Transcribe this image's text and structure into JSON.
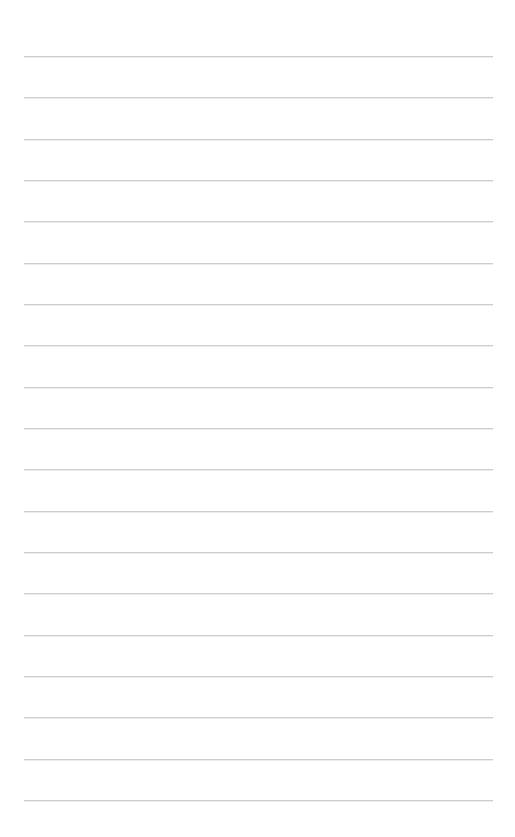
{
  "document": {
    "kind": "lined-paper",
    "title": "",
    "body_text": "",
    "background_color": "#ffffff",
    "width_px": 515,
    "height_px": 837
  },
  "ruling": {
    "line_color": "#cdcdd1",
    "line_thickness_px": 1,
    "line_count": 19,
    "left_margin_px": 24,
    "right_edge_px": 493,
    "line_length_px": 469,
    "first_line_y_px": 56,
    "last_line_y_px": 800,
    "line_spacing_px": 41.3,
    "lines": [
      {
        "index": 1,
        "y": 56,
        "x_start": 24,
        "x_end": 493,
        "content": ""
      },
      {
        "index": 2,
        "y": 97,
        "x_start": 24,
        "x_end": 493,
        "content": ""
      },
      {
        "index": 3,
        "y": 139,
        "x_start": 24,
        "x_end": 493,
        "content": ""
      },
      {
        "index": 4,
        "y": 180,
        "x_start": 24,
        "x_end": 493,
        "content": ""
      },
      {
        "index": 5,
        "y": 221,
        "x_start": 24,
        "x_end": 493,
        "content": ""
      },
      {
        "index": 6,
        "y": 263,
        "x_start": 24,
        "x_end": 493,
        "content": ""
      },
      {
        "index": 7,
        "y": 304,
        "x_start": 24,
        "x_end": 493,
        "content": ""
      },
      {
        "index": 8,
        "y": 345,
        "x_start": 24,
        "x_end": 493,
        "content": ""
      },
      {
        "index": 9,
        "y": 387,
        "x_start": 24,
        "x_end": 493,
        "content": ""
      },
      {
        "index": 10,
        "y": 428,
        "x_start": 24,
        "x_end": 493,
        "content": ""
      },
      {
        "index": 11,
        "y": 469,
        "x_start": 24,
        "x_end": 493,
        "content": ""
      },
      {
        "index": 12,
        "y": 511,
        "x_start": 24,
        "x_end": 493,
        "content": ""
      },
      {
        "index": 13,
        "y": 552,
        "x_start": 24,
        "x_end": 493,
        "content": ""
      },
      {
        "index": 14,
        "y": 593,
        "x_start": 24,
        "x_end": 493,
        "content": ""
      },
      {
        "index": 15,
        "y": 635,
        "x_start": 24,
        "x_end": 493,
        "content": ""
      },
      {
        "index": 16,
        "y": 676,
        "x_start": 24,
        "x_end": 493,
        "content": ""
      },
      {
        "index": 17,
        "y": 717,
        "x_start": 24,
        "x_end": 493,
        "content": ""
      },
      {
        "index": 18,
        "y": 759,
        "x_start": 24,
        "x_end": 493,
        "content": ""
      },
      {
        "index": 19,
        "y": 800,
        "x_start": 24,
        "x_end": 493,
        "content": ""
      }
    ]
  }
}
